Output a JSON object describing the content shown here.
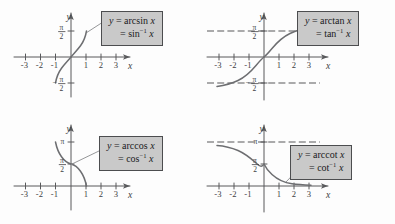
{
  "figure": {
    "panels": [
      {
        "id": "arcsin",
        "label_line1": "y = arcsin x",
        "label_line2": "= sin",
        "label_line2_sup": "-1",
        "label_line2_tail": "x",
        "x_axis_name": "x",
        "y_axis_name": "y",
        "x_ticks": [
          "-3",
          "-2",
          "-1",
          "1",
          "2",
          "3"
        ],
        "y_ticks": [
          "π/2",
          "-π/2"
        ],
        "domain": [
          -1,
          1
        ],
        "range": [
          "-π/2",
          "π/2"
        ],
        "has_asymptotes": false
      },
      {
        "id": "arctan",
        "label_line1": "y = arctan x",
        "label_line2": "= tan",
        "label_line2_sup": "-1",
        "label_line2_tail": "x",
        "x_axis_name": "x",
        "y_axis_name": "y",
        "x_ticks": [
          "-3",
          "-2",
          "-1",
          "1",
          "2",
          "3"
        ],
        "y_ticks": [
          "π/2",
          "-π/2"
        ],
        "domain": [
          -3.5,
          3.5
        ],
        "range": [
          "-π/2",
          "π/2"
        ],
        "has_asymptotes": true,
        "asymptotes": [
          "π/2",
          "-π/2"
        ]
      },
      {
        "id": "arccos",
        "label_line1": "y = arccos x",
        "label_line2": "= cos",
        "label_line2_sup": "-1",
        "label_line2_tail": "x",
        "x_axis_name": "x",
        "y_axis_name": "y",
        "x_ticks": [
          "-3",
          "-2",
          "-1",
          "1",
          "2",
          "3"
        ],
        "y_ticks": [
          "π",
          "π/2"
        ],
        "domain": [
          -1,
          1
        ],
        "range": [
          0,
          "π"
        ],
        "has_asymptotes": false
      },
      {
        "id": "arccot",
        "label_line1": "y = arccot x",
        "label_line2": "= cot",
        "label_line2_sup": "-1",
        "label_line2_tail": "x",
        "x_axis_name": "x",
        "y_axis_name": "y",
        "x_ticks": [
          "-3",
          "-2",
          "-1",
          "1",
          "2",
          "3"
        ],
        "y_ticks": [
          "π",
          "π/2"
        ],
        "domain": [
          -3.5,
          3.5
        ],
        "range": [
          0,
          "π"
        ],
        "has_asymptotes": true,
        "asymptotes": [
          "π"
        ]
      }
    ],
    "colors": {
      "background": "#fdfdfd",
      "axis": "#58595b",
      "curve": "#6d6e71",
      "callout_fill": "#c9c9c9",
      "callout_border": "#4c4d4f",
      "text": "#414042"
    }
  }
}
